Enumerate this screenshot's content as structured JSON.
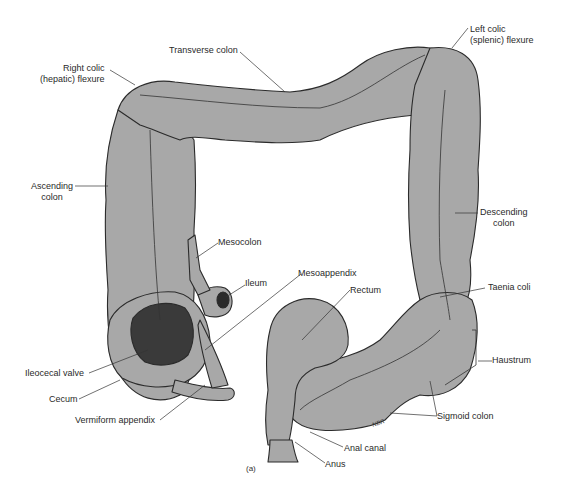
{
  "figure": {
    "caption": "(a)",
    "signature": "NBR",
    "colors": {
      "colon_fill": "#a8a8a8",
      "outline": "#2b2b2b",
      "lumen_dark": "#3a3a3a",
      "background": "#ffffff"
    }
  },
  "labels": {
    "transverse_colon": "Transverse colon",
    "right_colic_line1": "Right colic",
    "right_colic_line2": "(hepatic) flexure",
    "left_colic_line1": "Left colic",
    "left_colic_line2": "(splenic) flexure",
    "ascending_line1": "Ascending",
    "ascending_line2": "colon",
    "descending_line1": "Descending",
    "descending_line2": "colon",
    "mesocolon": "Mesocolon",
    "ileum": "Ileum",
    "mesoappendix": "Mesoappendix",
    "rectum": "Rectum",
    "taenia_coli": "Taenia coli",
    "haustrum": "Haustrum",
    "ileocecal_valve": "Ileocecal valve",
    "cecum": "Cecum",
    "vermiform_appendix": "Vermiform appendix",
    "sigmoid_colon": "Sigmoid colon",
    "anal_canal": "Anal canal",
    "anus": "Anus"
  }
}
